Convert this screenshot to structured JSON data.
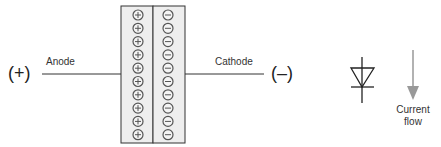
{
  "labels": {
    "anode_terminal": "(+)",
    "anode": "Anode",
    "cathode": "Cathode",
    "cathode_terminal": "(–)",
    "current_flow_line1": "Current",
    "current_flow_line2": "flow"
  },
  "charges": {
    "p_side": "+",
    "n_side": "−",
    "count_per_side": 10
  },
  "colors": {
    "line": "#333333",
    "box_fill": "#eeeeee",
    "charge_stroke": "#555555",
    "arrow": "#999999"
  }
}
